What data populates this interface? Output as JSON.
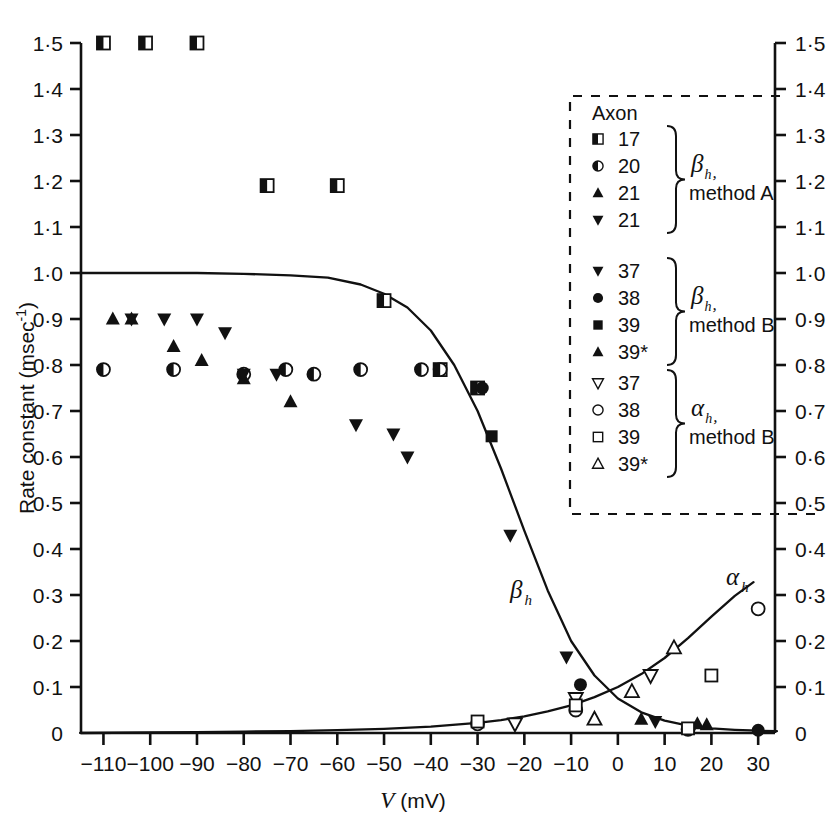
{
  "figure": {
    "title": "",
    "axis": {
      "y_label_text": "Rate constant (msec",
      "y_label_exp": "-1",
      "y_label_close": ")",
      "x_label_italic": "V",
      "x_label_unit": "(mV)",
      "y_ticks": [
        "0",
        "0·1",
        "0·2",
        "0·3",
        "0·4",
        "0·5",
        "0·6",
        "0·7",
        "0·8",
        "0·9",
        "1·0",
        "1·1",
        "1·2",
        "1·3",
        "1·4",
        "1·5"
      ],
      "y_tick_values": [
        0,
        0.1,
        0.2,
        0.3,
        0.4,
        0.5,
        0.6,
        0.7,
        0.8,
        0.9,
        1.0,
        1.1,
        1.2,
        1.3,
        1.4,
        1.5
      ],
      "x_ticks": [
        "−110",
        "−100",
        "−90",
        "−80",
        "−70",
        "−60",
        "−50",
        "−40",
        "−30",
        "−20",
        "−10",
        "0",
        "10",
        "20",
        "30"
      ],
      "x_tick_values": [
        -110,
        -100,
        -90,
        -80,
        -70,
        -60,
        -50,
        -40,
        -30,
        -20,
        -10,
        0,
        10,
        20,
        30
      ]
    },
    "curve_labels": {
      "beta": "β",
      "beta_sub": "h",
      "alpha": "α",
      "alpha_sub": "h"
    },
    "legend": {
      "header": "Axon",
      "groups": [
        {
          "group_label_main": "β",
          "group_label_sub": "h",
          "group_label_comma": ",",
          "group_method": "method A",
          "entries": [
            {
              "marker": "half-square",
              "label": "17"
            },
            {
              "marker": "half-circle",
              "label": "20"
            },
            {
              "marker": "filled-triangle-up",
              "label": "21"
            },
            {
              "marker": "filled-triangle-down",
              "label": "21"
            }
          ]
        },
        {
          "group_label_main": "β",
          "group_label_sub": "h",
          "group_label_comma": ",",
          "group_method": "method B",
          "entries": [
            {
              "marker": "filled-triangle-down",
              "label": "37"
            },
            {
              "marker": "filled-circle",
              "label": "38"
            },
            {
              "marker": "filled-square",
              "label": "39"
            },
            {
              "marker": "filled-triangle-up",
              "label": "39*"
            }
          ]
        },
        {
          "group_label_main": "α",
          "group_label_sub": "h",
          "group_label_comma": ",",
          "group_method": "method B",
          "entries": [
            {
              "marker": "open-triangle-down",
              "label": "37"
            },
            {
              "marker": "open-circle",
              "label": "38"
            },
            {
              "marker": "open-square",
              "label": "39"
            },
            {
              "marker": "open-triangle-up",
              "label": "39*"
            }
          ]
        }
      ]
    }
  },
  "chart_data": {
    "type": "scatter",
    "title": "",
    "xlabel": "V (mV)",
    "ylabel": "Rate constant (msec⁻¹)",
    "xlim": [
      -115,
      34
    ],
    "ylim": [
      0,
      1.5
    ],
    "grid": false,
    "legend_position": "right-upper",
    "axes_note": "dual y-axes, identical scale on left and right",
    "series": [
      {
        "name": "Axon 17, beta_h, method A",
        "marker": "half-square",
        "points": [
          {
            "x": -110,
            "y": 1.5
          },
          {
            "x": -101,
            "y": 1.5
          },
          {
            "x": -90,
            "y": 1.5
          },
          {
            "x": -75,
            "y": 1.19
          },
          {
            "x": -60,
            "y": 1.19
          },
          {
            "x": -50,
            "y": 0.94
          },
          {
            "x": -38,
            "y": 0.79
          },
          {
            "x": -30,
            "y": 0.75
          }
        ]
      },
      {
        "name": "Axon 20, beta_h, method A",
        "marker": "half-circle",
        "points": [
          {
            "x": -110,
            "y": 0.79
          },
          {
            "x": -95,
            "y": 0.79
          },
          {
            "x": -80,
            "y": 0.78
          },
          {
            "x": -71,
            "y": 0.79
          },
          {
            "x": -65,
            "y": 0.78
          },
          {
            "x": -55,
            "y": 0.79
          },
          {
            "x": -42,
            "y": 0.79
          },
          {
            "x": -38,
            "y": 0.79
          }
        ]
      },
      {
        "name": "Axon 21a, beta_h, method A",
        "marker": "filled-triangle-up",
        "points": [
          {
            "x": -108,
            "y": 0.9
          },
          {
            "x": -104,
            "y": 0.9
          },
          {
            "x": -95,
            "y": 0.84
          },
          {
            "x": -89,
            "y": 0.81
          },
          {
            "x": -80,
            "y": 0.77
          },
          {
            "x": -70,
            "y": 0.72
          }
        ]
      },
      {
        "name": "Axon 21b, beta_h, method A",
        "marker": "filled-triangle-down",
        "points": [
          {
            "x": -104,
            "y": 0.9
          },
          {
            "x": -97,
            "y": 0.9
          },
          {
            "x": -90,
            "y": 0.9
          },
          {
            "x": -84,
            "y": 0.87
          },
          {
            "x": -80,
            "y": 0.78
          },
          {
            "x": -73,
            "y": 0.78
          },
          {
            "x": -56,
            "y": 0.67
          },
          {
            "x": -48,
            "y": 0.65
          },
          {
            "x": -45,
            "y": 0.6
          }
        ]
      },
      {
        "name": "Axon 37, beta_h, method B",
        "marker": "filled-triangle-down",
        "points": [
          {
            "x": -23,
            "y": 0.43
          },
          {
            "x": -11,
            "y": 0.165
          },
          {
            "x": 8,
            "y": 0.025
          },
          {
            "x": 16,
            "y": 0.012
          }
        ]
      },
      {
        "name": "Axon 38, beta_h, method B",
        "marker": "filled-circle",
        "points": [
          {
            "x": -29,
            "y": 0.75
          },
          {
            "x": -8,
            "y": 0.105
          },
          {
            "x": 15,
            "y": 0.008
          },
          {
            "x": 30,
            "y": 0.006
          }
        ]
      },
      {
        "name": "Axon 39, beta_h, method B",
        "marker": "filled-square",
        "points": [
          {
            "x": -27,
            "y": 0.645
          }
        ]
      },
      {
        "name": "Axon 39*, beta_h, method B",
        "marker": "filled-triangle-up",
        "points": [
          {
            "x": 5,
            "y": 0.03
          },
          {
            "x": 17,
            "y": 0.02
          },
          {
            "x": 19,
            "y": 0.018
          }
        ]
      },
      {
        "name": "Axon 37, alpha_h, method B",
        "marker": "open-triangle-down",
        "points": [
          {
            "x": -22,
            "y": 0.02
          },
          {
            "x": -9,
            "y": 0.075
          },
          {
            "x": 7,
            "y": 0.125
          }
        ]
      },
      {
        "name": "Axon 38, alpha_h, method B",
        "marker": "open-circle",
        "points": [
          {
            "x": -30,
            "y": 0.02
          },
          {
            "x": -9,
            "y": 0.05
          },
          {
            "x": 15,
            "y": 0.008
          },
          {
            "x": 30,
            "y": 0.27
          }
        ]
      },
      {
        "name": "Axon 39, alpha_h, method B",
        "marker": "open-square",
        "points": [
          {
            "x": -30,
            "y": 0.025
          },
          {
            "x": -9,
            "y": 0.06
          },
          {
            "x": 15,
            "y": 0.01
          },
          {
            "x": 20,
            "y": 0.125
          }
        ]
      },
      {
        "name": "Axon 39*, alpha_h, method B",
        "marker": "open-triangle-up",
        "points": [
          {
            "x": -5,
            "y": 0.03
          },
          {
            "x": 3,
            "y": 0.09
          },
          {
            "x": 12,
            "y": 0.185
          }
        ]
      }
    ],
    "curves": [
      {
        "name": "beta_h",
        "label": "βh",
        "description": "sigmoid decreasing from 1.0 at -110 mV to near 0 at +30 mV",
        "points": [
          {
            "x": -115,
            "y": 1.0
          },
          {
            "x": -100,
            "y": 1.0
          },
          {
            "x": -90,
            "y": 1.0
          },
          {
            "x": -80,
            "y": 0.998
          },
          {
            "x": -70,
            "y": 0.995
          },
          {
            "x": -62,
            "y": 0.99
          },
          {
            "x": -55,
            "y": 0.975
          },
          {
            "x": -50,
            "y": 0.955
          },
          {
            "x": -45,
            "y": 0.925
          },
          {
            "x": -40,
            "y": 0.875
          },
          {
            "x": -35,
            "y": 0.8
          },
          {
            "x": -30,
            "y": 0.7
          },
          {
            "x": -25,
            "y": 0.575
          },
          {
            "x": -20,
            "y": 0.44
          },
          {
            "x": -15,
            "y": 0.31
          },
          {
            "x": -10,
            "y": 0.2
          },
          {
            "x": -5,
            "y": 0.125
          },
          {
            "x": 0,
            "y": 0.075
          },
          {
            "x": 5,
            "y": 0.045
          },
          {
            "x": 10,
            "y": 0.027
          },
          {
            "x": 15,
            "y": 0.016
          },
          {
            "x": 20,
            "y": 0.01
          },
          {
            "x": 25,
            "y": 0.007
          },
          {
            "x": 30,
            "y": 0.005
          },
          {
            "x": 34,
            "y": 0.004
          }
        ]
      },
      {
        "name": "alpha_h",
        "label": "αh",
        "description": "exponential rising from ~0 at -110 mV to ~0.33 at +30 mV",
        "points": [
          {
            "x": -115,
            "y": 0.0
          },
          {
            "x": -100,
            "y": 0.001
          },
          {
            "x": -90,
            "y": 0.002
          },
          {
            "x": -80,
            "y": 0.003
          },
          {
            "x": -70,
            "y": 0.004
          },
          {
            "x": -60,
            "y": 0.006
          },
          {
            "x": -50,
            "y": 0.009
          },
          {
            "x": -40,
            "y": 0.014
          },
          {
            "x": -30,
            "y": 0.022
          },
          {
            "x": -25,
            "y": 0.028
          },
          {
            "x": -20,
            "y": 0.036
          },
          {
            "x": -15,
            "y": 0.047
          },
          {
            "x": -10,
            "y": 0.06
          },
          {
            "x": -5,
            "y": 0.078
          },
          {
            "x": 0,
            "y": 0.1
          },
          {
            "x": 5,
            "y": 0.128
          },
          {
            "x": 10,
            "y": 0.163
          },
          {
            "x": 15,
            "y": 0.206
          },
          {
            "x": 20,
            "y": 0.253
          },
          {
            "x": 25,
            "y": 0.298
          },
          {
            "x": 29,
            "y": 0.328
          }
        ]
      }
    ]
  }
}
